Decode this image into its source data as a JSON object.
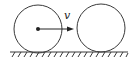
{
  "diagram": {
    "velocity_label": "v",
    "colors": {
      "stroke": "#3a3a3a",
      "background": "#ffffff"
    },
    "objects": [
      {
        "name": "moving-ball",
        "has_center_dot": true,
        "has_velocity": true
      },
      {
        "name": "stationary-ball",
        "has_center_dot": false,
        "has_velocity": false
      }
    ],
    "ground": {
      "type": "hatched-surface"
    }
  }
}
